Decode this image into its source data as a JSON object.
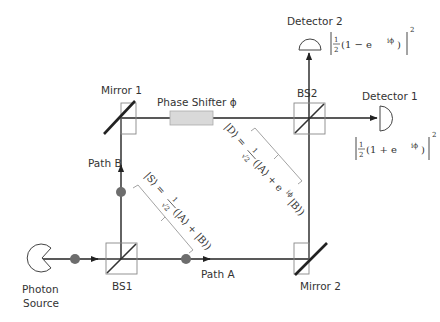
{
  "diagram": {
    "labels": {
      "photon_source": [
        "Photon",
        "Source"
      ],
      "bs1": "BS1",
      "bs2": "BS2",
      "mirror1": "Mirror 1",
      "mirror2": "Mirror 2",
      "path_a": "Path A",
      "path_b": "Path B",
      "phase_shifter": "Phase Shifter ϕ",
      "detector1": "Detector 1",
      "detector2": "Detector 2"
    },
    "equations": {
      "state_s": {
        "lhs": "|S⟩ =",
        "frac_num": "1",
        "frac_den": "√2",
        "rhs": "(|A⟩ + |B⟩)"
      },
      "state_d": {
        "lhs": "|D⟩ =",
        "frac_num": "1",
        "frac_den": "√2",
        "rhs": "(|A⟩ + e",
        "rhs_sup": "iϕ",
        "rhs_end": "|B⟩)"
      },
      "detector1_prob": {
        "frac_num": "1",
        "frac_den": "2",
        "body": "(1 + e",
        "sup": "iϕ",
        "close": ")",
        "power": "2"
      },
      "detector2_prob": {
        "frac_num": "1",
        "frac_den": "2",
        "body": "(1 − e",
        "sup": "iϕ",
        "close": ")",
        "power": "2"
      }
    },
    "colors": {
      "beam": "#222222",
      "photon": "#6d6d6d",
      "phase_shifter_fill": "#d9d9d9",
      "box_outline": "#888888",
      "bracket": "#999999",
      "text": "#333333"
    }
  }
}
